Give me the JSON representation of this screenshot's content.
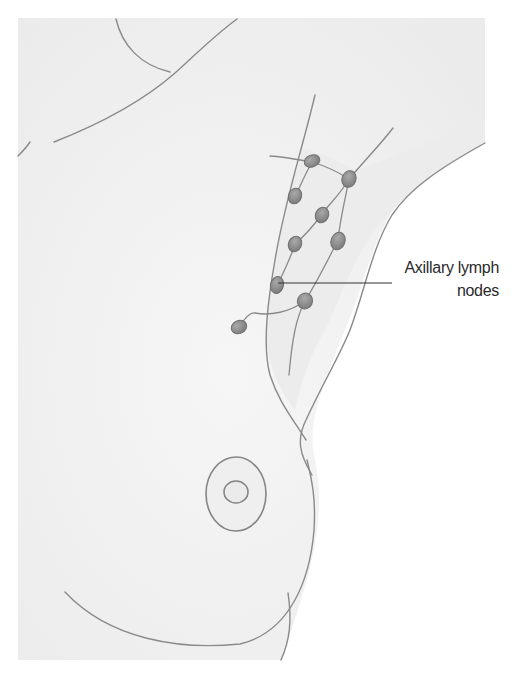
{
  "diagram": {
    "annotations": [
      {
        "id": "axillary-lymph-nodes",
        "text_line1": "Axillary lymph",
        "text_line2": "nodes"
      }
    ],
    "colors": {
      "outline": "#8a8a8a",
      "skin_fill": "#f3f3f3",
      "axilla_fill": "#ececec",
      "node_fill": "#8f8f8f",
      "node_stroke": "#6f6f6f",
      "leader_line": "#333333",
      "background": "#ffffff"
    },
    "node_count": 10
  }
}
